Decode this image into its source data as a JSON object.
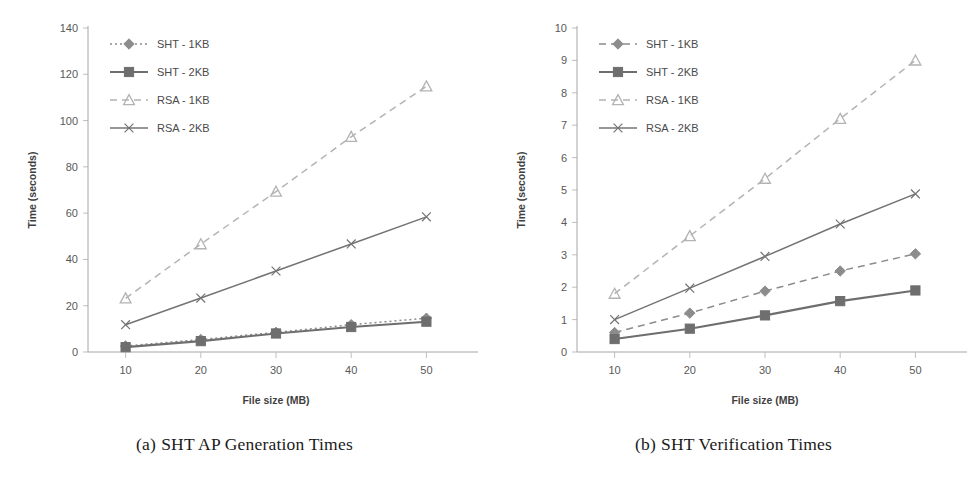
{
  "figure": {
    "panels": [
      {
        "caption_label": "(a)",
        "caption_text": "SHT AP Generation Times"
      },
      {
        "caption_label": "(b)",
        "caption_text": "SHT Verification Times"
      }
    ]
  },
  "chart_data": [
    {
      "type": "line",
      "title": "",
      "xlabel": "File size (MB)",
      "ylabel": "Time (seconds)",
      "x": [
        10,
        20,
        30,
        40,
        50
      ],
      "xticks": [
        "10",
        "20",
        "30",
        "40",
        "50"
      ],
      "yticks": [
        "0",
        "20",
        "40",
        "60",
        "80",
        "100",
        "120",
        "140"
      ],
      "xlim": [
        5,
        55
      ],
      "ylim": [
        0,
        140
      ],
      "grid": false,
      "legend_position": "top-left",
      "series": [
        {
          "name": "SHT - 1KB",
          "values": [
            2.6,
            5.4,
            8.5,
            11.8,
            14.6
          ],
          "marker": "diamond",
          "color": "#8c8c8c",
          "dash": "2,3"
        },
        {
          "name": "SHT - 2KB",
          "values": [
            2.1,
            4.7,
            8.0,
            10.8,
            13.1
          ],
          "marker": "square",
          "color": "#6e6e6e",
          "dash": "none"
        },
        {
          "name": "RSA - 1KB",
          "values": [
            23.2,
            46.6,
            69.3,
            93.0,
            114.8
          ],
          "marker": "triangle",
          "color": "#b3b3b3",
          "dash": "7,5"
        },
        {
          "name": "RSA - 2KB",
          "values": [
            11.8,
            23.3,
            35.0,
            46.7,
            58.4
          ],
          "marker": "cross",
          "color": "#737373",
          "dash": "none"
        }
      ]
    },
    {
      "type": "line",
      "title": "",
      "xlabel": "File size (MB)",
      "ylabel": "Time (seconds)",
      "x": [
        10,
        20,
        30,
        40,
        50
      ],
      "xticks": [
        "10",
        "20",
        "30",
        "40",
        "50"
      ],
      "yticks": [
        "0",
        "1",
        "2",
        "3",
        "4",
        "5",
        "6",
        "7",
        "8",
        "9",
        "10"
      ],
      "xlim": [
        5,
        55
      ],
      "ylim": [
        0,
        10
      ],
      "grid": false,
      "legend_position": "top-left",
      "series": [
        {
          "name": "SHT - 1KB",
          "values": [
            0.6,
            1.2,
            1.88,
            2.5,
            3.03
          ],
          "marker": "diamond",
          "color": "#8c8c8c",
          "dash": "7,5"
        },
        {
          "name": "SHT - 2KB",
          "values": [
            0.4,
            0.72,
            1.13,
            1.57,
            1.9
          ],
          "marker": "square",
          "color": "#6e6e6e",
          "dash": "none"
        },
        {
          "name": "RSA - 1KB",
          "values": [
            1.8,
            3.58,
            5.35,
            7.2,
            9.0
          ],
          "marker": "triangle",
          "color": "#b3b3b3",
          "dash": "7,5"
        },
        {
          "name": "RSA - 2KB",
          "values": [
            1.0,
            1.97,
            2.95,
            3.95,
            4.88
          ],
          "marker": "cross",
          "color": "#737373",
          "dash": "none"
        }
      ]
    }
  ]
}
